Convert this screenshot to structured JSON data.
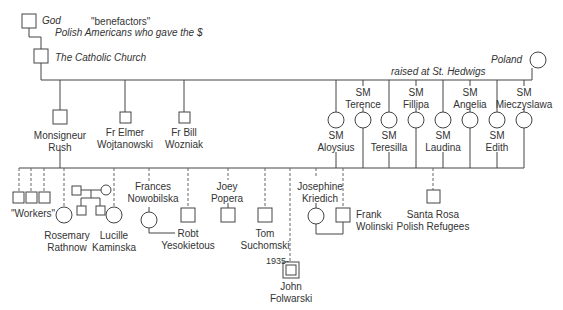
{
  "diagram": {
    "type": "genogram",
    "top": {
      "god": "God",
      "benefactors_quote": "\"benefactors\"",
      "benefactors": "Polish Americans who gave the $",
      "church": "The Catholic Church",
      "poland": "Poland",
      "raised": "raised at St. Hedwigs"
    },
    "clergy": [
      {
        "line1": "Monsigneur",
        "line2": "Rush",
        "shape": "square"
      },
      {
        "line1": "Fr Elmer",
        "line2": "Wojtanowski",
        "shape": "square"
      },
      {
        "line1": "Fr Bill",
        "line2": "Wozniak",
        "shape": "square"
      }
    ],
    "sisters": [
      {
        "line1": "SM",
        "line2": "Aloysius",
        "shape": "circle"
      },
      {
        "line1": "SM",
        "line2": "Terence",
        "shape": "circle"
      },
      {
        "line1": "SM",
        "line2": "Teresilla",
        "shape": "circle"
      },
      {
        "line1": "SM",
        "line2": "Fillipa",
        "shape": "circle"
      },
      {
        "line1": "SM",
        "line2": "Laudina",
        "shape": "circle"
      },
      {
        "line1": "SM",
        "line2": "Angelia",
        "shape": "circle"
      },
      {
        "line1": "SM",
        "line2": "Edith",
        "shape": "circle"
      },
      {
        "line1": "SM",
        "line2": "Mieczyslawa",
        "shape": "circle"
      }
    ],
    "community": {
      "workers": "\"Workers\"",
      "rosemary": {
        "line1": "Rosemary",
        "line2": "Rathnow"
      },
      "lucille": {
        "line1": "Lucille",
        "line2": "Kaminska"
      },
      "frances": {
        "line1": "Frances",
        "line2": "Nowobilska"
      },
      "robt": {
        "line1": "Robt",
        "line2": "Yesokietous"
      },
      "joey": {
        "line1": "Joey",
        "line2": "Popera"
      },
      "tom": {
        "line1": "Tom",
        "line2": "Suchomski"
      },
      "josephine": {
        "line1": "Josephine",
        "line2": "Kriedich"
      },
      "frank": {
        "line1": "Frank",
        "line2": "Wolinski"
      },
      "santa_rosa": {
        "line1": "Santa Rosa",
        "line2": "Polish Refugees"
      },
      "john": {
        "line1": "John",
        "line2": "Folwarski",
        "year": "1935-"
      }
    }
  }
}
